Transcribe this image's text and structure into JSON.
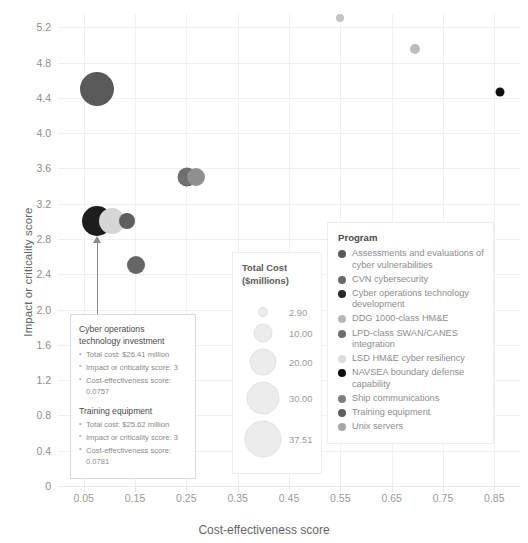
{
  "chart_data": {
    "type": "scatter",
    "title": "",
    "xlabel": "Cost-effectiveness score",
    "ylabel": "Impact or criticality score",
    "xlim": [
      0.0,
      0.9
    ],
    "ylim": [
      0,
      5.35
    ],
    "xticks": [
      "0.05",
      "0.15",
      "0.25",
      "0.35",
      "0.45",
      "0.55",
      "0.65",
      "0.75",
      "0.85"
    ],
    "xtick_values": [
      0.05,
      0.15,
      0.25,
      0.35,
      0.45,
      0.55,
      0.65,
      0.75,
      0.85
    ],
    "yticks": [
      "0",
      "0.4",
      "0.8",
      "1.2",
      "1.6",
      "2.0",
      "2.4",
      "2.8",
      "3.2",
      "3.6",
      "4.0",
      "4.4",
      "4.8",
      "5.2"
    ],
    "ytick_values": [
      0,
      0.4,
      0.8,
      1.2,
      1.6,
      2.0,
      2.4,
      2.8,
      3.2,
      3.6,
      4.0,
      4.4,
      4.8,
      5.2
    ],
    "grid": true,
    "legend_position": "right",
    "size_encoding": "Total Cost ($millions)",
    "color_encoding": "Program",
    "points": [
      {
        "program": "CVN cybersecurity",
        "x": 0.075,
        "y": 4.5,
        "cost": 31.0,
        "color": "#595959",
        "r": 17
      },
      {
        "program": "Unix servers",
        "x": 0.695,
        "y": 4.95,
        "cost": 3.6,
        "color": "#bdbdbd",
        "r": 5
      },
      {
        "program": "NAVSEA boundary defense capability",
        "x": 0.862,
        "y": 4.47,
        "cost": 2.9,
        "color": "#111111",
        "r": 4.5
      },
      {
        "program": "LPD-class SWAN/CANES integration",
        "x": 0.252,
        "y": 3.5,
        "cost": 10.5,
        "color": "#6e6e6e",
        "r": 9.5
      },
      {
        "program": "Ship communications",
        "x": 0.268,
        "y": 3.5,
        "cost": 10.0,
        "color": "#8f8f8f",
        "r": 9
      },
      {
        "program": "Cyber operations technology development",
        "x": 0.0757,
        "y": 3.0,
        "cost": 26.41,
        "color": "#1d1d1d",
        "r": 15
      },
      {
        "program": "LSD HM&E cyber resiliency",
        "x": 0.105,
        "y": 3.0,
        "cost": 19.0,
        "color": "#d6d6d6",
        "r": 13
      },
      {
        "program": "Training equipment",
        "x": 0.135,
        "y": 3.0,
        "cost": 25.62,
        "color": "#5e5e5e",
        "r": 8
      },
      {
        "program": "Assessments and evaluations of cyber vulnerabilities",
        "x": 0.152,
        "y": 2.5,
        "cost": 9.5,
        "color": "#656565",
        "r": 9
      },
      {
        "program": "DDG 1000-class HM&E",
        "x": 0.55,
        "y": 5.3,
        "cost": 37.51,
        "color": "#c4c4c4",
        "r": 4
      }
    ]
  },
  "axes": {
    "x_title": "Cost-effectiveness score",
    "y_title": "Impact or criticality score"
  },
  "size_legend": {
    "title_line1": "Total Cost",
    "title_line2": "($millions)",
    "entries": [
      {
        "label": "2.90",
        "r": 5
      },
      {
        "label": "10.00",
        "r": 9.5
      },
      {
        "label": "20.00",
        "r": 13.5
      },
      {
        "label": "30.00",
        "r": 16.5
      },
      {
        "label": "37.51",
        "r": 18.5
      }
    ]
  },
  "color_legend": {
    "title": "Program",
    "items": [
      {
        "label": "Assessments and evaluations of cyber vulnerabilities",
        "color": "#5a5a5a"
      },
      {
        "label": "CVN cybersecurity",
        "color": "#6b6b6b"
      },
      {
        "label": "Cyber operations technology development",
        "color": "#272727"
      },
      {
        "label": "DDG 1000-class HM&E",
        "color": "#b9b9b9"
      },
      {
        "label": "LPD-class SWAN/CANES integration",
        "color": "#6e6e6e"
      },
      {
        "label": "LSD HM&E cyber resiliency",
        "color": "#dcdcdc"
      },
      {
        "label": "NAVSEA boundary defense capability",
        "color": "#0d0d0d"
      },
      {
        "label": "Ship communications",
        "color": "#7e7e7e"
      },
      {
        "label": "Training equipment",
        "color": "#5e5e5e"
      },
      {
        "label": "Unix servers",
        "color": "#a6a6a6"
      }
    ]
  },
  "annotation": {
    "group1": {
      "title": "Cyber operations technology investment",
      "bullets": [
        "Total cost: $26.41 million",
        "Impact or criticality score: 3",
        "Cost-effectiveness score: 0.0757"
      ]
    },
    "group2": {
      "title": "Training equipment",
      "bullets": [
        "Total cost: $25.62 million",
        "Impact or criticality score: 3",
        "Cost-effectiveness score: 0.0781"
      ]
    }
  }
}
